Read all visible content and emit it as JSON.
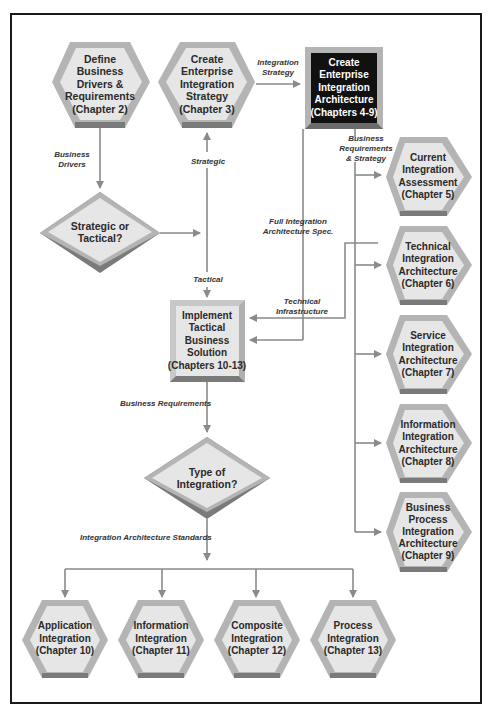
{
  "nodes": {
    "define_business": {
      "lines": [
        "Define",
        "Business",
        "Drivers &",
        "Requirements",
        "(Chapter 2)"
      ]
    },
    "create_strategy": {
      "lines": [
        "Create",
        "Enterprise",
        "Integration",
        "Strategy",
        "(Chapter 3)"
      ]
    },
    "create_architecture": {
      "lines": [
        "Create",
        "Enterprise",
        "Integration",
        "Architecture",
        "(Chapters 4-9)"
      ]
    },
    "strategic_or_tactical": {
      "lines": [
        "Strategic or",
        "Tactical?"
      ]
    },
    "implement_tactical": {
      "lines": [
        "Implement",
        "Tactical",
        "Business",
        "Solution",
        "(Chapters 10-13)"
      ]
    },
    "type_of_integration": {
      "lines": [
        "Type of",
        "Integration?"
      ]
    },
    "current_assessment": {
      "lines": [
        "Current",
        "Integration",
        "Assessment",
        "(Chapter 5)"
      ]
    },
    "technical_arch": {
      "lines": [
        "Technical",
        "Integration",
        "Architecture",
        "(Chapter 6)"
      ]
    },
    "service_arch": {
      "lines": [
        "Service",
        "Integration",
        "Architecture",
        "(Chapter 7)"
      ]
    },
    "information_arch": {
      "lines": [
        "Information",
        "Integration",
        "Architecture",
        "(Chapter 8)"
      ]
    },
    "business_process_arch": {
      "lines": [
        "Business",
        "Process",
        "Integration",
        "Architecture",
        "(Chapter 9)"
      ]
    },
    "application_integration": {
      "lines": [
        "Application",
        "Integration",
        "(Chapter 10)"
      ]
    },
    "information_integration": {
      "lines": [
        "Information",
        "Integration",
        "(Chapter 11)"
      ]
    },
    "composite_integration": {
      "lines": [
        "Composite",
        "Integration",
        "(Chapter 12)"
      ]
    },
    "process_integration": {
      "lines": [
        "Process",
        "Integration",
        "(Chapter 13)"
      ]
    }
  },
  "edge_labels": {
    "integration_strategy": [
      "Integration",
      "Strategy"
    ],
    "business_drivers": [
      "Business",
      "Drivers"
    ],
    "strategic": [
      "Strategic"
    ],
    "tactical": [
      "Tactical"
    ],
    "business_req_strategy": [
      "Business",
      "Requirements",
      "& Strategy"
    ],
    "full_arch_spec": [
      "Full Integration",
      "Architecture Spec."
    ],
    "technical_infrastructure": [
      "Technical",
      "Infrastructure"
    ],
    "business_requirements": [
      "Business Requirements"
    ],
    "arch_standards": [
      "Integration Architecture Standards"
    ]
  },
  "colors": {
    "node_fill": "#e6e6e6",
    "node_border": "#b4b4b4",
    "node_shadow": "#7a7a7a",
    "dark_fill": "#111111",
    "line": "#8a8a8a",
    "frame": "#1a1a1a"
  }
}
